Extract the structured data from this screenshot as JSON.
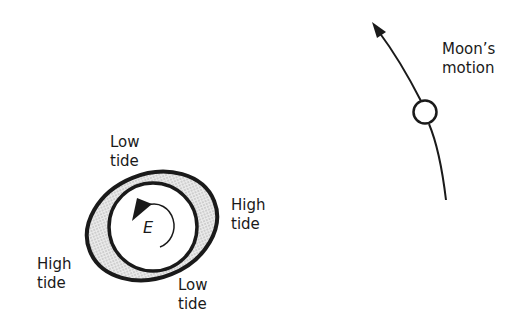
{
  "diagram": {
    "earth_label": "E",
    "labels": {
      "low_tide_top": {
        "line1": "Low",
        "line2": "tide"
      },
      "high_tide_right": {
        "line1": "High",
        "line2": "tide"
      },
      "high_tide_left": {
        "line1": "High",
        "line2": "tide"
      },
      "low_tide_bottom": {
        "line1": "Low",
        "line2": "tide"
      },
      "moon_motion": {
        "line1": "Moon’s",
        "line2": "motion"
      }
    },
    "colors": {
      "stroke": "#1a1a1a",
      "tidal_bulge_fill": "#d9d9d9",
      "background": "#ffffff"
    }
  }
}
